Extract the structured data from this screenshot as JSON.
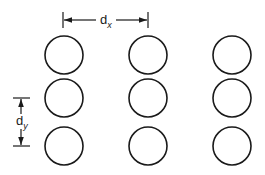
{
  "diagram": {
    "stroke_color": "#1a1a1a",
    "background": "#ffffff",
    "grid": {
      "columns_x": [
        64,
        148,
        232
      ],
      "rows_y": [
        55,
        98,
        146
      ],
      "radius": 19
    },
    "dimensions": {
      "dx": {
        "label": "d",
        "subscript": "x"
      },
      "dy": {
        "label": "d",
        "subscript": "y"
      }
    }
  }
}
